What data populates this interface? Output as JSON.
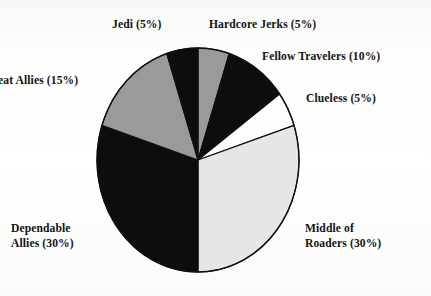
{
  "figure": {
    "background_color": "#ffffff",
    "text_color": "#141414"
  },
  "chart_data": {
    "type": "pie",
    "title": "",
    "subtitle": "",
    "xlabel": "",
    "ylabel": "",
    "legend_position": "none",
    "grid": false,
    "label_format": "{name} ({value}%)",
    "start_angle_deg": 0,
    "direction": "clockwise",
    "categories": [
      "Hardcore Jerks",
      "Fellow Travelers",
      "Clueless",
      "Middle of Roaders",
      "Dependable Allies",
      "Great Allies",
      "Jedi"
    ],
    "values": [
      5,
      10,
      5,
      30,
      30,
      15,
      5
    ],
    "units": "%",
    "total": 100,
    "slices": [
      {
        "name": "Hardcore Jerks",
        "value": 5,
        "label": "Hardcore Jerks (5%)",
        "color": "#9a9a9a",
        "start_deg": 0,
        "end_deg": 18
      },
      {
        "name": "Fellow Travelers",
        "value": 10,
        "label": "Fellow Travelers (10%)",
        "color": "#0d0d0d",
        "start_deg": 18,
        "end_deg": 54
      },
      {
        "name": "Clueless",
        "value": 5,
        "label": "Clueless (5%)",
        "color": "#fdfdfd",
        "start_deg": 54,
        "end_deg": 72
      },
      {
        "name": "Middle of Roaders",
        "value": 30,
        "label": "Middle of Roaders (30%)",
        "label_line1": "Middle of",
        "label_line2": "Roaders (30%)",
        "color": "#e6e6e6",
        "start_deg": 72,
        "end_deg": 180
      },
      {
        "name": "Dependable Allies",
        "value": 30,
        "label": "Dependable Allies (30%)",
        "label_line1": "Dependable",
        "label_line2": "Allies (30%)",
        "color": "#0d0d0d",
        "start_deg": 180,
        "end_deg": 288
      },
      {
        "name": "Great Allies",
        "value": 15,
        "label": "reat Allies (15%)",
        "color": "#9a9a9a",
        "start_deg": 288,
        "end_deg": 342
      },
      {
        "name": "Jedi",
        "value": 5,
        "label": "Jedi (5%)",
        "color": "#0d0d0d",
        "start_deg": 342,
        "end_deg": 360
      }
    ]
  },
  "labels": {
    "jedi": "Jedi (5%)",
    "hardcore_jerks": "Hardcore Jerks (5%)",
    "fellow_travelers": "Fellow Travelers (10%)",
    "clueless": "Clueless (5%)",
    "great_allies": "reat Allies (15%)",
    "dependable_allies_line1": "Dependable",
    "dependable_allies_line2": "Allies (30%)",
    "middle_of_roaders_line1": "Middle of",
    "middle_of_roaders_line2": "Roaders (30%)"
  },
  "geometry": {
    "center_x": 198,
    "center_y": 160,
    "radius_x": 101,
    "radius_y": 112,
    "outline_color": "#101010",
    "outline_width": 1.4
  }
}
